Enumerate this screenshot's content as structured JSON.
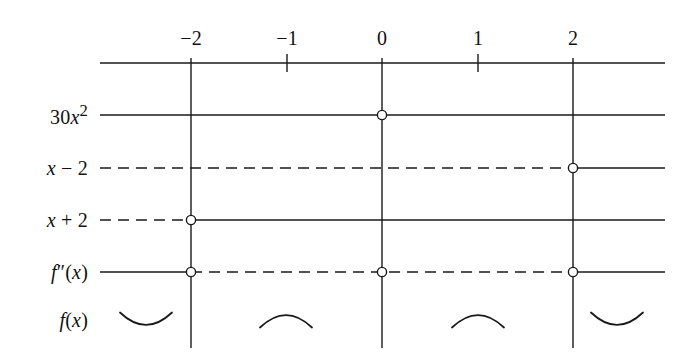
{
  "figure": {
    "type": "sign-chart",
    "background_color": "#ffffff",
    "line_color": "#1a1a1a"
  },
  "axis": {
    "name": "number-line",
    "y": 63,
    "x_start": 100,
    "x_end": 665,
    "ticks": [
      {
        "label": "−2",
        "value": -2,
        "x": 191,
        "major": true
      },
      {
        "label": "−1",
        "value": -1,
        "x": 287,
        "major": false
      },
      {
        "label": "0",
        "value": 0,
        "x": 382,
        "major": true
      },
      {
        "label": "1",
        "value": 1,
        "x": 478,
        "major": false
      },
      {
        "label": "2",
        "value": 2,
        "x": 573,
        "major": true
      }
    ],
    "label_y": 38
  },
  "verticals": [
    {
      "name": "vline-neg2",
      "x": 191,
      "y_top": 58,
      "y_bottom": 348
    },
    {
      "name": "vline-zero",
      "x": 382,
      "y_top": 58,
      "y_bottom": 348
    },
    {
      "name": "vline-pos2",
      "x": 573,
      "y_top": 58,
      "y_bottom": 348
    }
  ],
  "rows": [
    {
      "name": "row-30x2",
      "label": "30x²",
      "label_html": "30<i>x</i><sup>2</sup>",
      "y": 115,
      "segments": [
        {
          "from": 100,
          "to": 665,
          "style": "solid"
        }
      ],
      "circles": [
        382
      ]
    },
    {
      "name": "row-x-minus-2",
      "label": "x − 2",
      "label_html": "<i>x</i> − 2",
      "y": 168,
      "segments": [
        {
          "from": 100,
          "to": 573,
          "style": "dashed"
        },
        {
          "from": 573,
          "to": 665,
          "style": "solid"
        }
      ],
      "circles": [
        573
      ]
    },
    {
      "name": "row-x-plus-2",
      "label": "x + 2",
      "label_html": "<i>x</i> + 2",
      "y": 220,
      "segments": [
        {
          "from": 100,
          "to": 191,
          "style": "dashed"
        },
        {
          "from": 191,
          "to": 665,
          "style": "solid"
        }
      ],
      "circles": [
        191
      ]
    },
    {
      "name": "row-f-double-prime",
      "label": "f″(x)",
      "label_html": "<i>f</i>″(<i>x</i>)",
      "y": 272,
      "segments": [
        {
          "from": 100,
          "to": 191,
          "style": "solid"
        },
        {
          "from": 191,
          "to": 573,
          "style": "dashed"
        },
        {
          "from": 573,
          "to": 665,
          "style": "solid"
        }
      ],
      "circles": [
        191,
        382,
        573
      ]
    }
  ],
  "concavity_row": {
    "name": "row-f-of-x",
    "label": "f(x)",
    "label_html": "<i>f</i>(<i>x</i>)",
    "y": 320,
    "arcs": [
      {
        "name": "arc-concave-up-left",
        "center_x": 146,
        "shape": "concave-up"
      },
      {
        "name": "arc-concave-down-left-mid",
        "center_x": 286,
        "shape": "concave-down"
      },
      {
        "name": "arc-concave-down-right-mid",
        "center_x": 478,
        "shape": "concave-down"
      },
      {
        "name": "arc-concave-up-right",
        "center_x": 617,
        "shape": "concave-up"
      }
    ]
  },
  "label_column": {
    "right_edge": 88
  }
}
